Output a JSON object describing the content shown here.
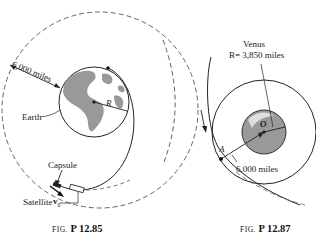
{
  "figures": [
    {
      "id": "fig-12-85",
      "caption_prefix": "FIG.",
      "caption_number": "P 12.85",
      "labels": {
        "distance": "6,000 miles",
        "planet": "Earth",
        "radius": "R",
        "capsule": "Capsule",
        "velocity": "v",
        "velocity_sub": "0",
        "satellite": "Satellite"
      }
    },
    {
      "id": "fig-12-87",
      "caption_prefix": "FIG.",
      "caption_number": "P 12.87",
      "labels": {
        "planet": "Venus",
        "radius_eq": "R= 3,850 miles",
        "center": "O",
        "point": "A",
        "distance": "6,000 miles"
      }
    }
  ],
  "colors": {
    "line": "#222222",
    "planet_fill": "#9a9a9a",
    "dashed": "#555555"
  }
}
